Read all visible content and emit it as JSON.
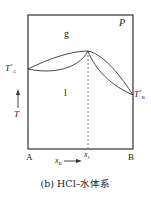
{
  "diagram": {
    "type": "phase-diagram",
    "labels": {
      "pressure": "P",
      "gas_region": "g",
      "liquid_region": "l",
      "ta_main": "T",
      "ta_sup": "*",
      "ta_sub": "A",
      "tb_main": "T",
      "tb_sup": "*",
      "tb_sub": "B",
      "temperature_axis": "T",
      "component_a": "A",
      "component_b": "B",
      "x1_main": "x",
      "x1_sub": "1",
      "xb_main": "x",
      "xb_sub": "B"
    },
    "caption": "(b) HCl–水体系",
    "colors": {
      "line": "#333333",
      "background": "#ffffff"
    }
  }
}
